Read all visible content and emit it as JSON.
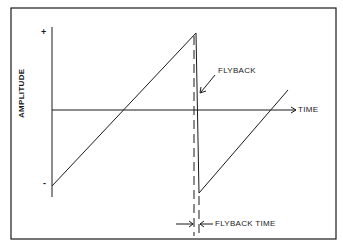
{
  "diagram": {
    "type": "sawtooth-waveform",
    "labels": {
      "y_axis": "AMPLITUDE",
      "x_axis": "TIME",
      "plus": "+",
      "minus": "-",
      "flyback": "FLYBACK",
      "flyback_time": "FLYBACK TIME"
    },
    "colors": {
      "line": "#1a1a1a",
      "background": "#ffffff"
    }
  }
}
